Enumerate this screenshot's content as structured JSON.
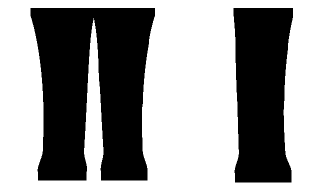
{
  "figure": {
    "type": "bone-scintigraphy",
    "modality": "Tc-99m bone scan",
    "background_color": "#ffffff",
    "ink_color": "#262626",
    "width": 321,
    "height": 191
  },
  "panels": [
    {
      "id": "a",
      "label": "(a)",
      "label_x": 11,
      "label_y": 13,
      "view": "anterior both lower legs",
      "limb_count": 2,
      "limbs": [
        {
          "name": "left-tibia",
          "cx": 62,
          "top": 16,
          "bottom": 172,
          "half_width_top": 30,
          "half_width_bottom": 19,
          "cortex_offset": 16,
          "focus": null
        },
        {
          "name": "right-tibia",
          "cx": 124,
          "top": 16,
          "bottom": 172,
          "half_width_top": 29,
          "half_width_bottom": 18,
          "cortex_offset": -14,
          "focus": {
            "name": "focal-hot-spot",
            "cx": 133,
            "cy": 72,
            "rx": 4.5,
            "ry": 7.5,
            "intensity": 0.96
          }
        }
      ]
    },
    {
      "id": "b",
      "label": "(b)",
      "label_x": 14,
      "label_y": 13,
      "view": "anterior single lower leg magnified",
      "limb_count": 1,
      "limbs": [
        {
          "name": "affected-tibia",
          "cx": 98,
          "top": 16,
          "bottom": 174,
          "half_width_top": 28,
          "half_width_bottom": 22,
          "cortex_offset": 0,
          "focus": {
            "name": "focal-hot-spot",
            "cx": 97,
            "cy": 70,
            "rx": 3.6,
            "ry": 11,
            "intensity": 1.0
          }
        }
      ]
    }
  ],
  "chart_data": {
    "type": "heatmap",
    "title": "",
    "xlabel": "",
    "ylabel": "",
    "grid": false,
    "legend": "none",
    "colormap": "grayscale-inverted",
    "series": [
      {
        "name": "panel-a-left-tibia",
        "peak_uptake": 0.55,
        "background_uptake": 0.12,
        "focal_lesion": false
      },
      {
        "name": "panel-a-right-tibia",
        "peak_uptake": 0.96,
        "background_uptake": 0.12,
        "focal_lesion": true,
        "focal_x": 133,
        "focal_y": 72
      },
      {
        "name": "panel-b-tibia",
        "peak_uptake": 1.0,
        "background_uptake": 0.12,
        "focal_lesion": true,
        "focal_x": 262,
        "focal_y": 70
      }
    ]
  }
}
